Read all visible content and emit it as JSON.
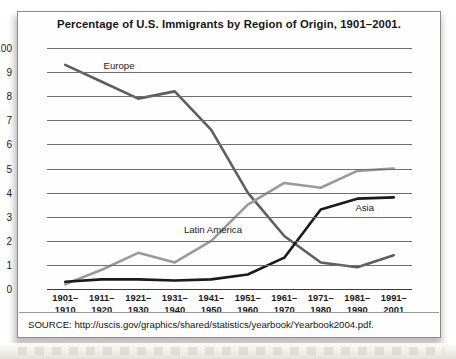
{
  "figure": {
    "title": "Percentage of U.S. Immigrants by Region of Origin, 1901–2001.",
    "source": "SOURCE: http://uscis.gov/graphics/shared/statistics/yearbook/Yearbook2004.pdf."
  },
  "chart_data": {
    "type": "line",
    "title": "Percentage of U.S. Immigrants by Region of Origin, 1901–2001.",
    "xlabel": "",
    "ylabel": "",
    "grid": true,
    "legend_position": "inline-annotations",
    "categories": [
      "1901–1910",
      "1911–1920",
      "1921–1930",
      "1931–1940",
      "1941–1950",
      "1951–1960",
      "1961–1970",
      "1971–1980",
      "1981–1990",
      "1991–2001"
    ],
    "category_lines": [
      [
        "1901–",
        "1910"
      ],
      [
        "1911–",
        "1920"
      ],
      [
        "1921–",
        "1930"
      ],
      [
        "1931–",
        "1940"
      ],
      [
        "1941–",
        "1950"
      ],
      [
        "1951–",
        "1960"
      ],
      [
        "1961–",
        "1970"
      ],
      [
        "1971–",
        "1980"
      ],
      [
        "1981–",
        "1990"
      ],
      [
        "1991–",
        "2001"
      ]
    ],
    "ytick_labels": [
      "100",
      "9",
      "8",
      "7",
      "6",
      "5",
      "4",
      "3",
      "2",
      "1",
      "0"
    ],
    "ytick_values": [
      10,
      9,
      8,
      7,
      6,
      5,
      4,
      3,
      2,
      1,
      0
    ],
    "ylim": [
      0,
      10
    ],
    "series": [
      {
        "name": "Europe",
        "color": "#5e5e5e",
        "values": [
          9.3,
          8.6,
          7.9,
          8.2,
          6.6,
          4.0,
          2.2,
          1.1,
          0.9,
          1.4
        ]
      },
      {
        "name": "Latin America",
        "color": "#9a9a9a",
        "values": [
          0.2,
          0.8,
          1.5,
          1.1,
          2.0,
          3.5,
          4.4,
          4.2,
          4.9,
          5.0
        ]
      },
      {
        "name": "Asia",
        "color": "#1a1a1a",
        "values": [
          0.3,
          0.4,
          0.4,
          0.35,
          0.4,
          0.6,
          1.3,
          3.3,
          3.75,
          3.8
        ]
      }
    ],
    "annotations": [
      {
        "text": "Europe",
        "x_frac": 0.155,
        "y_value": 9.25
      },
      {
        "text": "Latin America",
        "x_frac": 0.375,
        "y_value": 2.45
      },
      {
        "text": "Asia",
        "x_frac": 0.845,
        "y_value": 3.35
      }
    ]
  }
}
